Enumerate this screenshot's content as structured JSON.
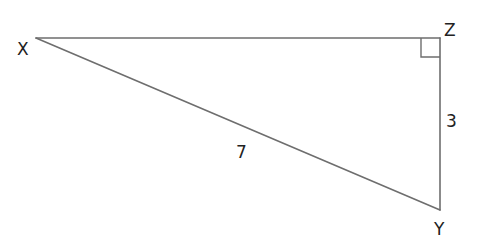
{
  "diagram": {
    "type": "right-triangle",
    "vertices": {
      "X": {
        "label": "X",
        "x": 36,
        "y": 38
      },
      "Z": {
        "label": "Z",
        "x": 440,
        "y": 38
      },
      "Y": {
        "label": "Y",
        "x": 440,
        "y": 210
      }
    },
    "right_angle_at": "Z",
    "sides": [
      {
        "from": "X",
        "to": "Z",
        "label": ""
      },
      {
        "from": "Z",
        "to": "Y",
        "label": "3"
      },
      {
        "from": "X",
        "to": "Y",
        "label": "7"
      }
    ],
    "labels": {
      "x_vertex": "X",
      "y_vertex": "Y",
      "z_vertex": "Z",
      "side_zy": "3",
      "side_xy": "7"
    },
    "colors": {
      "line": "#6e6e6e",
      "text": "#222222",
      "background": "#ffffff"
    }
  }
}
